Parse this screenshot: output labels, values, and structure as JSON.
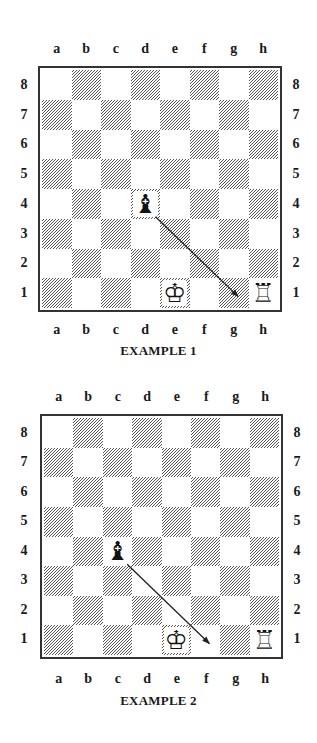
{
  "files": [
    "a",
    "b",
    "c",
    "d",
    "e",
    "f",
    "g",
    "h"
  ],
  "ranks": [
    "8",
    "7",
    "6",
    "5",
    "4",
    "3",
    "2",
    "1"
  ],
  "examples": [
    {
      "caption": "EXAMPLE 1",
      "pieces": [
        {
          "square": "d4",
          "piece": "black-bishop",
          "glyph": "♝"
        },
        {
          "square": "e1",
          "piece": "white-king",
          "glyph": "♔"
        },
        {
          "square": "h1",
          "piece": "white-rook",
          "glyph": "♖"
        }
      ],
      "arrow": {
        "from": "d4",
        "to": "g1"
      }
    },
    {
      "caption": "EXAMPLE 2",
      "pieces": [
        {
          "square": "c4",
          "piece": "black-bishop",
          "glyph": "♝"
        },
        {
          "square": "e1",
          "piece": "white-king",
          "glyph": "♔"
        },
        {
          "square": "h1",
          "piece": "white-rook",
          "glyph": "♖"
        }
      ],
      "arrow": {
        "from": "c4",
        "to": "f1"
      }
    }
  ],
  "colors": {
    "frame": "#333333",
    "hatch": "#555555",
    "background": "#ffffff",
    "text": "#1a1a1a"
  }
}
